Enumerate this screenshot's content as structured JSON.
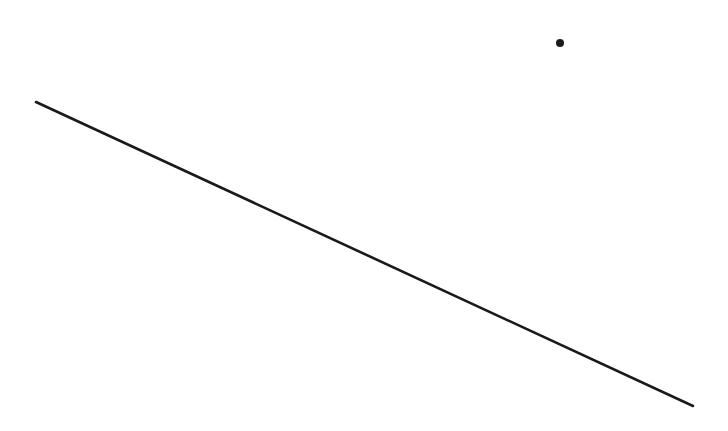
{
  "diagram": {
    "width": 728,
    "height": 431,
    "background": "#ffffff",
    "stroke_color": "#1a1a1a",
    "line": {
      "x1": 36,
      "y1": 102,
      "x2": 693,
      "y2": 406,
      "stroke_width": 2.6
    },
    "point": {
      "cx": 560,
      "cy": 43,
      "r": 4
    }
  }
}
